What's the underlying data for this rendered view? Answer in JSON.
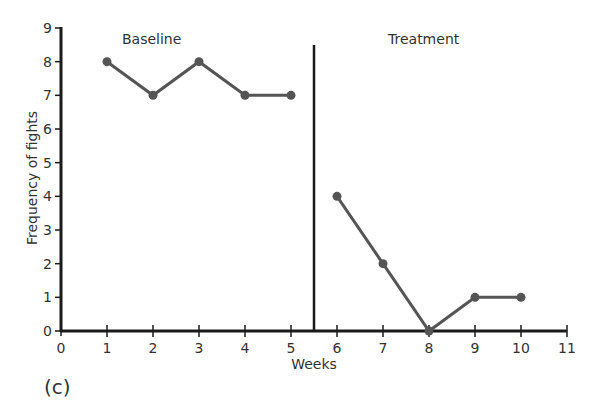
{
  "chart_data": {
    "type": "line",
    "title": "",
    "panel_label": "(c)",
    "xlabel": "Weeks",
    "ylabel": "Frequency of fights",
    "xlim": [
      0,
      11
    ],
    "ylim": [
      0,
      9
    ],
    "x_ticks": [
      0,
      1,
      2,
      3,
      4,
      5,
      6,
      7,
      8,
      9,
      10,
      11
    ],
    "y_ticks": [
      0,
      1,
      2,
      3,
      4,
      5,
      6,
      7,
      8,
      9
    ],
    "grid": false,
    "phase_divider_x": 5.5,
    "annotations": [
      "Baseline",
      "Treatment"
    ],
    "series": [
      {
        "name": "Baseline",
        "x": [
          1,
          2,
          3,
          4,
          5
        ],
        "values": [
          8,
          7,
          8,
          7,
          7
        ]
      },
      {
        "name": "Treatment",
        "x": [
          6,
          7,
          8,
          9,
          10
        ],
        "values": [
          4,
          2,
          0,
          1,
          1
        ]
      }
    ],
    "colors": {
      "line": "#555555",
      "axis": "#1a1a1a"
    }
  }
}
